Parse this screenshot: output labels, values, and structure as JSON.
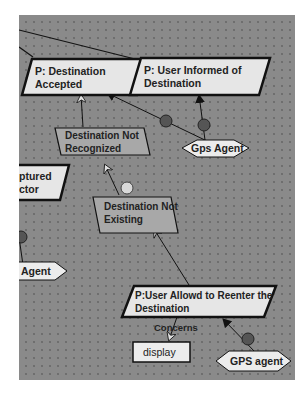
{
  "diagram": {
    "colors": {
      "canvas": "#8a8a8a",
      "goal_fill": "#e6e6e6",
      "softgoal_fill": "#a8a8a8",
      "agent_fill": "#ececec",
      "object_fill": "#ececec",
      "resolution_node": "#555555",
      "obstacle_node": "#d8d8d8"
    },
    "goals": [
      {
        "id": "g1",
        "label_line1": "P: Destination",
        "label_line2": "Accepted"
      },
      {
        "id": "g2",
        "label_line1": "P: User Informed of",
        "label_line2": "Destination"
      },
      {
        "id": "g3",
        "label_line1": "P:User Allowd to Reenter the",
        "label_line2": "Destination"
      },
      {
        "id": "g4",
        "label_line1": "ptured",
        "label_line2": "ctor"
      }
    ],
    "obstacles": [
      {
        "id": "o1",
        "label_line1": "Destination Not",
        "label_line2": "Recognized"
      },
      {
        "id": "o2",
        "label_line1": "Destination Not",
        "label_line2": "Existing"
      }
    ],
    "agents": [
      {
        "id": "a1",
        "label": "Gps Agent"
      },
      {
        "id": "a2",
        "label": "GPS agent"
      },
      {
        "id": "a3",
        "label": "Agent"
      }
    ],
    "objects": [
      {
        "id": "e1",
        "label": "display"
      }
    ],
    "relations": [
      {
        "label": "Concerns"
      }
    ]
  }
}
